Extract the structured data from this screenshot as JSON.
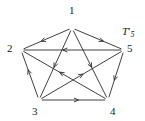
{
  "figure": {
    "kind": "directed-graph-diagram",
    "name_base": "T",
    "name_prime": "′",
    "name_subscript": "5",
    "name_full": "T′5",
    "stroke_color": "#2b2b2b",
    "background_color": "#ffffff",
    "text_color": "#1a1a1a"
  },
  "vertices": [
    {
      "id": "1",
      "label": "1",
      "x": 72,
      "y": 28,
      "label_x": 69,
      "label_y": 5
    },
    {
      "id": "2",
      "label": "2",
      "x": 21,
      "y": 50,
      "label_x": 7,
      "label_y": 43
    },
    {
      "id": "3",
      "label": "3",
      "x": 39,
      "y": 100,
      "label_x": 32,
      "label_y": 106
    },
    {
      "id": "4",
      "label": "4",
      "x": 108,
      "y": 100,
      "label_x": 110,
      "label_y": 106
    },
    {
      "id": "5",
      "label": "5",
      "x": 124,
      "y": 50,
      "label_x": 127,
      "label_y": 43
    }
  ],
  "edges": [
    {
      "from": "1",
      "to": "2",
      "arrow_at": 0.62,
      "kind": "pentagon-side"
    },
    {
      "from": "1",
      "to": "5",
      "arrow_at": 0.62,
      "kind": "pentagon-side"
    },
    {
      "from": "3",
      "to": "2",
      "arrow_at": 0.62,
      "kind": "pentagon-side"
    },
    {
      "from": "5",
      "to": "4",
      "arrow_at": 0.62,
      "kind": "pentagon-side"
    },
    {
      "from": "3",
      "to": "4",
      "arrow_at": 0.58,
      "kind": "pentagon-side"
    },
    {
      "from": "5",
      "to": "2",
      "arrow_at": 0.6,
      "kind": "diagonal"
    },
    {
      "from": "1",
      "to": "3",
      "arrow_at": 0.55,
      "kind": "diagonal"
    },
    {
      "from": "1",
      "to": "4",
      "arrow_at": 0.55,
      "kind": "diagonal"
    },
    {
      "from": "4",
      "to": "2",
      "arrow_at": 0.56,
      "kind": "diagonal"
    },
    {
      "from": "3",
      "to": "5",
      "arrow_at": 0.52,
      "kind": "diagonal"
    }
  ]
}
